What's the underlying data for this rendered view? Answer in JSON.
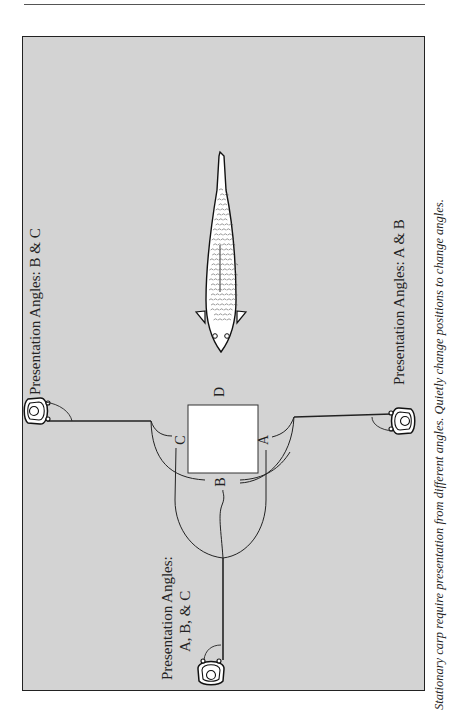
{
  "diagram": {
    "caption": "Stationary carp require presentation from different angles. Quietly change positions to change angles.",
    "labels": {
      "top_angler": "Presentation Angles: B & C",
      "right_angler": "Presentation Angles: A & B",
      "bottom_angler_line1": "Presentation Angles:",
      "bottom_angler_line2": "A, B, & C"
    },
    "target_letters": {
      "a": "A",
      "b": "B",
      "c": "C",
      "d": "D"
    },
    "icons": {
      "angler": "angler-top-view-icon",
      "fish": "carp-top-view-icon",
      "target": "white-square-target"
    },
    "colors": {
      "background": "#d3d3d3",
      "line": "#222222",
      "target": "#ffffff"
    }
  }
}
